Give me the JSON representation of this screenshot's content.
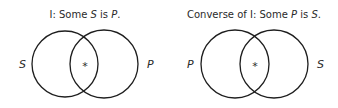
{
  "diagrams": [
    {
      "title_prefix": "I:  Some ",
      "title_term1": "S",
      "title_mid": " is ",
      "title_term2": "P",
      "title_end": ".",
      "left_label": "S",
      "right_label": "P",
      "marker": "*"
    },
    {
      "title_prefix": "Converse of I:  Some ",
      "title_term1": "P",
      "title_mid": " is ",
      "title_term2": "S",
      "title_end": ".",
      "left_label": "P",
      "right_label": "S",
      "marker": "*"
    }
  ]
}
